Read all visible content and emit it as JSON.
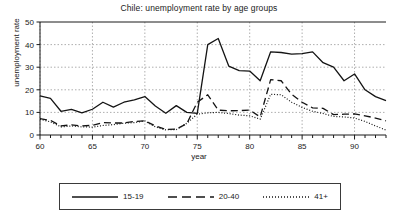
{
  "chart_data": {
    "type": "line",
    "title": "Chile: unemployment rate by age groups",
    "xlabel": "year",
    "ylabel": "unemployment rate",
    "xlim": [
      60,
      93
    ],
    "ylim": [
      0,
      50
    ],
    "xticks": [
      60,
      65,
      70,
      75,
      80,
      85,
      90
    ],
    "yticks": [
      0,
      10,
      20,
      30,
      40,
      50
    ],
    "xtick_labels": [
      "60",
      "65",
      "70",
      "75",
      "80",
      "85",
      "90"
    ],
    "ytick_labels": [
      "0",
      "10",
      "20",
      "30",
      "40",
      "50"
    ],
    "minor_xtick_interval": 1,
    "grid": "dotted vertical at xticks and dotted horizontal at yticks",
    "legend_position": "below-plot",
    "x": [
      60,
      61,
      62,
      63,
      64,
      65,
      66,
      67,
      68,
      69,
      70,
      71,
      72,
      73,
      74,
      75,
      76,
      77,
      78,
      79,
      80,
      81,
      82,
      83,
      84,
      85,
      86,
      87,
      88,
      89,
      90,
      91,
      92,
      93
    ],
    "series": [
      {
        "name": "15-19",
        "style": "solid",
        "values": [
          17.3,
          16.2,
          10.5,
          11.3,
          9.8,
          11.4,
          14.5,
          12.3,
          14.5,
          15.5,
          17.0,
          12.8,
          9.6,
          13.0,
          10.0,
          9.6,
          40.0,
          42.7,
          30.5,
          28.5,
          28.3,
          24.0,
          36.8,
          36.5,
          35.8,
          36.0,
          36.8,
          32.0,
          30.0,
          24.0,
          27.0,
          20.0,
          17.0,
          15.2
        ]
      },
      {
        "name": "20-40",
        "style": "dashed",
        "values": [
          7.2,
          6.5,
          4.0,
          4.5,
          4.0,
          4.3,
          5.5,
          5.3,
          5.3,
          6.0,
          6.3,
          4.0,
          2.5,
          2.6,
          5.0,
          14.5,
          17.8,
          11.0,
          10.7,
          10.8,
          11.0,
          8.0,
          24.5,
          24.0,
          18.0,
          14.5,
          12.0,
          11.8,
          9.0,
          9.2,
          9.3,
          8.5,
          7.5,
          6.3
        ]
      },
      {
        "name": "41+",
        "style": "dotted",
        "values": [
          7.0,
          5.8,
          3.6,
          4.0,
          3.6,
          3.5,
          4.2,
          4.6,
          5.2,
          5.5,
          6.2,
          3.6,
          2.3,
          2.4,
          5.2,
          9.2,
          9.8,
          10.0,
          9.5,
          8.8,
          8.5,
          7.0,
          18.0,
          17.8,
          14.5,
          12.2,
          10.5,
          9.5,
          8.2,
          8.0,
          7.5,
          6.0,
          4.0,
          2.2
        ]
      }
    ]
  },
  "legend": {
    "items": [
      {
        "label": "15-19",
        "style": "solid"
      },
      {
        "label": "20-40",
        "style": "dashed"
      },
      {
        "label": "41+",
        "style": "dotted"
      }
    ]
  }
}
